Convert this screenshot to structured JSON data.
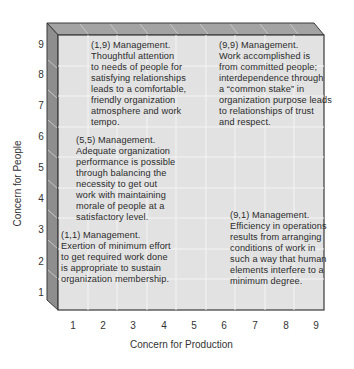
{
  "diagram": {
    "type": "managerial-grid",
    "x_axis": {
      "label": "Concern for Production",
      "ticks": [
        "1",
        "2",
        "3",
        "4",
        "5",
        "6",
        "7",
        "8",
        "9"
      ]
    },
    "y_axis": {
      "label": "Concern for People",
      "ticks": [
        "9",
        "8",
        "7",
        "6",
        "5",
        "4",
        "3",
        "2",
        "1"
      ]
    },
    "colors": {
      "face": "#e2e2e2",
      "grid": "#f4f4f4",
      "bevel_top": "#9a9a9a",
      "bevel_left": "#8a8a8a",
      "outline": "#3a3a3a"
    },
    "styles": [
      {
        "id": "1_9",
        "title": "(1,9) Management.",
        "lines": [
          "Thoughtful attention",
          "to needs of people for",
          "satisfying relationships",
          "leads to a comfortable,",
          "friendly organization",
          "atmosphere and work",
          "tempo."
        ]
      },
      {
        "id": "9_9",
        "title": "(9,9) Management.",
        "lines": [
          "Work accomplished is",
          "from committed people;",
          "interdependence through",
          "a “common stake” in",
          "organization purpose leads",
          "to relationships of trust",
          "and respect."
        ]
      },
      {
        "id": "5_5",
        "title": "(5,5) Management.",
        "lines": [
          "Adequate organization",
          "performance is possible",
          "through balancing the",
          "necessity to get out",
          "work with maintaining",
          "morale of people at a",
          "satisfactory level."
        ]
      },
      {
        "id": "1_1",
        "title": "(1,1) Management.",
        "lines": [
          "Exertion of minimum effort",
          "to get required work done",
          "is appropriate to sustain",
          "organization membership."
        ]
      },
      {
        "id": "9_1",
        "title": "(9,1) Management.",
        "lines": [
          "Efficiency in operations",
          "results from arranging",
          "conditions of work in",
          "such a way that human",
          "elements interfere to a",
          "minimum degree."
        ]
      }
    ]
  }
}
